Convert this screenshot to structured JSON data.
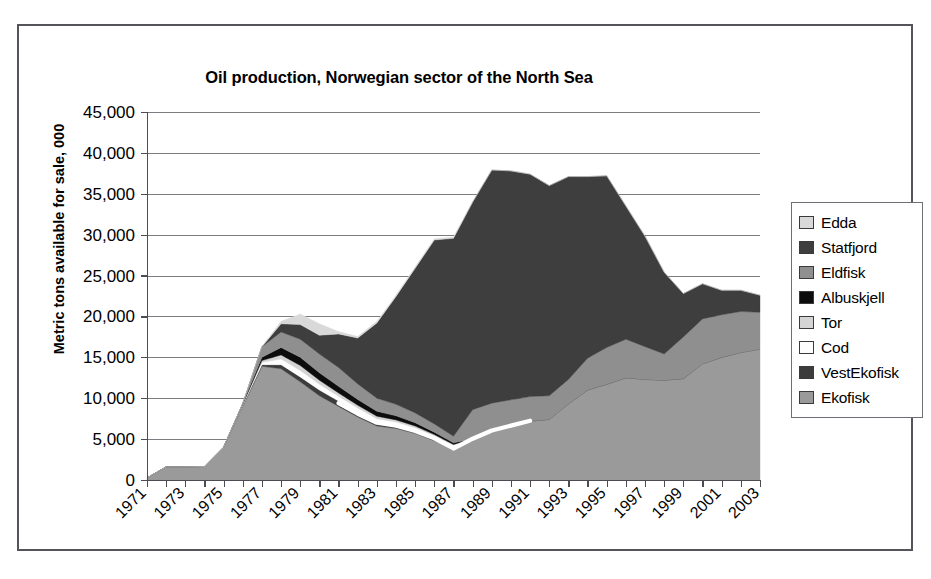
{
  "chart_data": {
    "type": "area",
    "title": "Oil production, Norwegian sector of the North Sea",
    "xlabel": "",
    "ylabel": "Metric tons available for sale, 000",
    "stacked": true,
    "grid": true,
    "legend_position": "right",
    "ylim": [
      0,
      45000
    ],
    "yticks": [
      0,
      5000,
      10000,
      15000,
      20000,
      25000,
      30000,
      35000,
      40000,
      45000
    ],
    "ytick_labels": [
      "0",
      "5,000",
      "10,000",
      "15,000",
      "20,000",
      "25,000",
      "30,000",
      "35,000",
      "40,000",
      "45,000"
    ],
    "x": [
      1971,
      1972,
      1973,
      1974,
      1975,
      1976,
      1977,
      1978,
      1979,
      1980,
      1981,
      1982,
      1983,
      1984,
      1985,
      1986,
      1987,
      1988,
      1989,
      1990,
      1991,
      1992,
      1993,
      1994,
      1995,
      1996,
      1997,
      1998,
      1999,
      2000,
      2001,
      2002,
      2003
    ],
    "xtick_labels": [
      "1971",
      "1973",
      "1975",
      "1977",
      "1979",
      "1981",
      "1983",
      "1985",
      "1987",
      "1989",
      "1991",
      "1993",
      "1995",
      "1997",
      "1999",
      "2001",
      "2003"
    ],
    "xtick_label_rotation": -45,
    "series": [
      {
        "name": "Ekofisk",
        "color": "#9a9a9a",
        "values": [
          250,
          1600,
          1600,
          1650,
          4000,
          9000,
          13900,
          13600,
          12000,
          10300,
          9000,
          7700,
          6600,
          6300,
          5700,
          4800,
          3800,
          5000,
          6000,
          6600,
          7200,
          7400,
          9300,
          11000,
          11700,
          12500,
          12300,
          12200,
          12400,
          14200,
          15000,
          15600,
          16000
        ]
      },
      {
        "name": "VestEkofisk",
        "color": "#3c3c3c",
        "values": [
          0,
          0,
          0,
          0,
          0,
          100,
          200,
          500,
          600,
          700,
          650,
          600,
          500,
          450,
          400,
          350,
          250,
          0,
          0,
          0,
          0,
          0,
          0,
          0,
          0,
          0,
          0,
          0,
          0,
          0,
          0,
          0,
          0
        ]
      },
      {
        "name": "Cod",
        "color": "#fdfdfd",
        "values": [
          0,
          0,
          0,
          0,
          0,
          100,
          300,
          700,
          800,
          700,
          600,
          500,
          400,
          350,
          300,
          250,
          200,
          0,
          0,
          0,
          0,
          0,
          0,
          0,
          0,
          0,
          0,
          0,
          0,
          0,
          0,
          0,
          0
        ]
      },
      {
        "name": "Tor",
        "color": "#d4d4d4",
        "values": [
          0,
          0,
          0,
          0,
          0,
          50,
          200,
          500,
          600,
          500,
          400,
          350,
          300,
          250,
          200,
          150,
          100,
          0,
          0,
          0,
          0,
          0,
          0,
          0,
          0,
          0,
          0,
          0,
          0,
          0,
          0,
          0,
          0
        ]
      },
      {
        "name": "Albuskjell",
        "color": "#0d0d0d",
        "values": [
          0,
          0,
          0,
          0,
          0,
          100,
          400,
          900,
          1000,
          900,
          800,
          700,
          600,
          500,
          400,
          300,
          200,
          0,
          0,
          0,
          0,
          0,
          0,
          0,
          0,
          0,
          0,
          0,
          0,
          0,
          0,
          0,
          0
        ]
      },
      {
        "name": "Eldfisk",
        "color": "#8f8f8f",
        "values": [
          0,
          0,
          0,
          0,
          0,
          0,
          1300,
          1900,
          2200,
          2300,
          2300,
          1900,
          1600,
          1400,
          1200,
          1000,
          800,
          3600,
          3400,
          3200,
          3000,
          2900,
          3000,
          3900,
          4500,
          4700,
          4000,
          3200,
          5100,
          5500,
          5200,
          5000,
          4500
        ]
      },
      {
        "name": "Statfjord",
        "color": "#3e3e3e",
        "values": [
          0,
          0,
          0,
          0,
          0,
          0,
          0,
          1000,
          1800,
          2300,
          4100,
          5600,
          9200,
          13200,
          17700,
          22500,
          24200,
          25400,
          28500,
          28000,
          27200,
          25700,
          24800,
          22200,
          21000,
          16300,
          13500,
          10000,
          5300,
          4300,
          3000,
          2600,
          2100
        ]
      },
      {
        "name": "Edda",
        "color": "#d9d9d9",
        "values": [
          0,
          0,
          0,
          0,
          0,
          0,
          0,
          300,
          1300,
          1400,
          300,
          200,
          200,
          150,
          150,
          150,
          150,
          0,
          0,
          0,
          0,
          0,
          0,
          0,
          0,
          0,
          0,
          0,
          0,
          0,
          0,
          0,
          0
        ]
      }
    ],
    "cod_line": {
      "name": "Cod boundary line",
      "color": "#ffffff",
      "x": [
        1981,
        1982,
        1983,
        1984,
        1985,
        1986,
        1987,
        1988,
        1989,
        1990,
        1991
      ],
      "values": [
        9400,
        8100,
        7000,
        6650,
        6000,
        5100,
        3850,
        5050,
        6050,
        6650,
        7250
      ]
    },
    "totals": [
      250,
      1600,
      1600,
      1650,
      4000,
      9350,
      16300,
      19400,
      20300,
      19100,
      18150,
      17550,
      19400,
      22350,
      25650,
      29500,
      29700,
      34000,
      37900,
      37800,
      37400,
      36000,
      37100,
      37100,
      37200,
      33500,
      29800,
      25400,
      22800,
      24000,
      23200,
      23200,
      22600
    ],
    "peak": {
      "year": 1992,
      "value": 40500
    }
  },
  "legend": {
    "items": [
      {
        "label": "Edda",
        "color": "#d9d9d9"
      },
      {
        "label": "Statfjord",
        "color": "#3e3e3e"
      },
      {
        "label": "Eldfisk",
        "color": "#8f8f8f"
      },
      {
        "label": "Albuskjell",
        "color": "#0d0d0d"
      },
      {
        "label": "Tor",
        "color": "#d4d4d4"
      },
      {
        "label": "Cod",
        "color": "#fdfdfd"
      },
      {
        "label": "VestEkofisk",
        "color": "#3c3c3c"
      },
      {
        "label": "Ekofisk",
        "color": "#9a9a9a"
      }
    ]
  },
  "colors": {
    "frame_border": "#54545a",
    "gridline": "#7b7b80",
    "axis": "#4c4c52",
    "background": "#ffffff",
    "text": "#000000"
  }
}
